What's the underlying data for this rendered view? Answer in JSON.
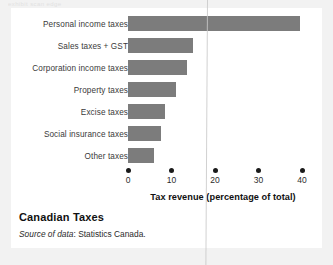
{
  "scan": {
    "header_fragment": "exhibit scan edge"
  },
  "caption": {
    "title": "Canadian Taxes",
    "source_prefix": "Source of data",
    "source_rest": ": Statistics Canada."
  },
  "chart_data": {
    "type": "bar",
    "orientation": "horizontal",
    "title": "Canadian Taxes",
    "xlabel": "Tax revenue (percentage of total)",
    "ylabel": "",
    "xlim": [
      0,
      40
    ],
    "xticks": [
      0,
      10,
      20,
      30,
      40
    ],
    "xtick_labels": [
      "0",
      "10",
      "20",
      "30",
      "40"
    ],
    "grid": false,
    "legend": false,
    "bar_color": "#7c7c7c",
    "categories": [
      "Personal income taxes",
      "Sales taxes + GST",
      "Corporation income taxes",
      "Property taxes",
      "Excise taxes",
      "Social insurance taxes",
      "Other taxes"
    ],
    "values": [
      39.5,
      15,
      13.5,
      11,
      8.5,
      7.5,
      6
    ]
  }
}
